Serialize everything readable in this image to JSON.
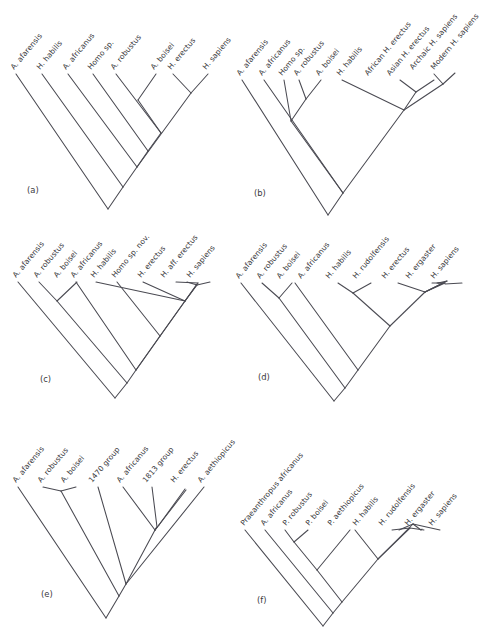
{
  "figure": {
    "type": "cladogram-figure",
    "background_color": "#ffffff",
    "line_color": "#4a4a52",
    "text_color": "#3a3a40",
    "panel_count": 6
  },
  "panels": [
    {
      "id": "a",
      "label": "(a)",
      "taxa": [
        "A. afarensis",
        "H. habilis",
        "A. africanus",
        "Homo sp.",
        "A. robustus",
        "A. boisei",
        "H. erectus",
        "H. sapiens"
      ]
    },
    {
      "id": "b",
      "label": "(b)",
      "taxa": [
        "A. afarensis",
        "A. africanus",
        "Homo sp.",
        "A. robustus",
        "A. boisei",
        "H. habilis",
        "African H. erectus",
        "Asian H. erectus",
        "Archaic H. sapiens",
        "Modern H. sapiens"
      ]
    },
    {
      "id": "c",
      "label": "(c)",
      "taxa": [
        "A. afarensis",
        "A. robustus",
        "A. boisei",
        "A. africanus",
        "H. habilis",
        "Homo sp. nov.",
        "H. erectus",
        "H. aff. erectus",
        "H. sapiens"
      ]
    },
    {
      "id": "d",
      "label": "(d)",
      "taxa": [
        "A. afarensis",
        "A. robustus",
        "A. boisei",
        "A. africanus",
        "H. habilis",
        "H. rudolfensis",
        "H. erectus",
        "H. ergaster",
        "H. sapiens"
      ]
    },
    {
      "id": "e",
      "label": "(e)",
      "taxa": [
        "A. afarensis",
        "A. robustus",
        "A. boisei",
        "1470 group",
        "A. africanus",
        "1813 group",
        "H. erectus",
        "A. aethiopicus"
      ]
    },
    {
      "id": "f",
      "label": "(f)",
      "taxa": [
        "Praeanthropus africanus",
        "A. africanus",
        "P. robustus",
        "P. boisei",
        "P. aethiopicus",
        "H. habilis",
        "H. rudolfensis",
        "H. ergaster",
        "H. sapiens"
      ]
    }
  ]
}
